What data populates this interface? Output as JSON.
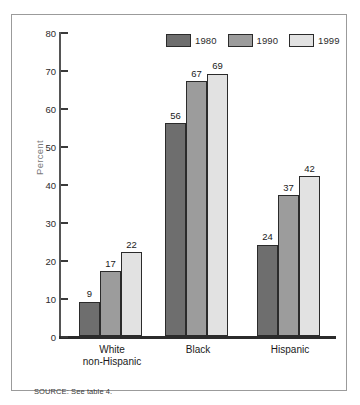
{
  "chart_data": {
    "type": "bar",
    "title": "",
    "subtitle": "",
    "xlabel": "",
    "ylabel": "Percent",
    "ylim": [
      0,
      80
    ],
    "yticks": [
      0,
      10,
      20,
      30,
      40,
      50,
      60,
      70,
      80
    ],
    "grid": false,
    "legend_position": "top-right",
    "categories": [
      "White non-Hispanic",
      "Black",
      "Hispanic"
    ],
    "category_lines": [
      [
        "White",
        "non-Hispanic"
      ],
      [
        "Black"
      ],
      [
        "Hispanic"
      ]
    ],
    "series": [
      {
        "name": "1980",
        "color": "#6e6e6e",
        "values": [
          9,
          56,
          24
        ]
      },
      {
        "name": "1990",
        "color": "#9c9c9c",
        "values": [
          17,
          67,
          37
        ]
      },
      {
        "name": "1999",
        "color": "#e2e2e2",
        "values": [
          22,
          69,
          42
        ]
      }
    ],
    "source_note": "SOURCE: See table 4."
  }
}
